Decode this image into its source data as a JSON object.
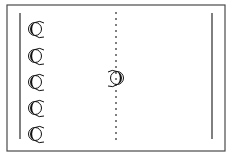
{
  "diagram": {
    "type": "court-formation",
    "colors": {
      "line": "#2a2a2a",
      "border": "#4a4a4a",
      "background": "#ffffff"
    },
    "court": {
      "x": 7,
      "y": 5,
      "width": 218,
      "height": 146
    },
    "left_line": {
      "x": 20,
      "y1": 13,
      "y2": 139
    },
    "right_line": {
      "x": 212,
      "y1": 13,
      "y2": 139
    },
    "center_line": {
      "x": 116,
      "y1": 12,
      "y2": 140,
      "style": "dashed"
    },
    "players": [
      {
        "id": "left-1",
        "cx": 34,
        "cy": 29,
        "facing": "right"
      },
      {
        "id": "left-2",
        "cx": 34,
        "cy": 56,
        "facing": "right"
      },
      {
        "id": "left-3",
        "cx": 34,
        "cy": 82,
        "facing": "right"
      },
      {
        "id": "left-4",
        "cx": 34,
        "cy": 108,
        "facing": "right"
      },
      {
        "id": "left-5",
        "cx": 34,
        "cy": 134,
        "facing": "right"
      },
      {
        "id": "center",
        "cx": 118,
        "cy": 78,
        "facing": "left"
      }
    ]
  }
}
